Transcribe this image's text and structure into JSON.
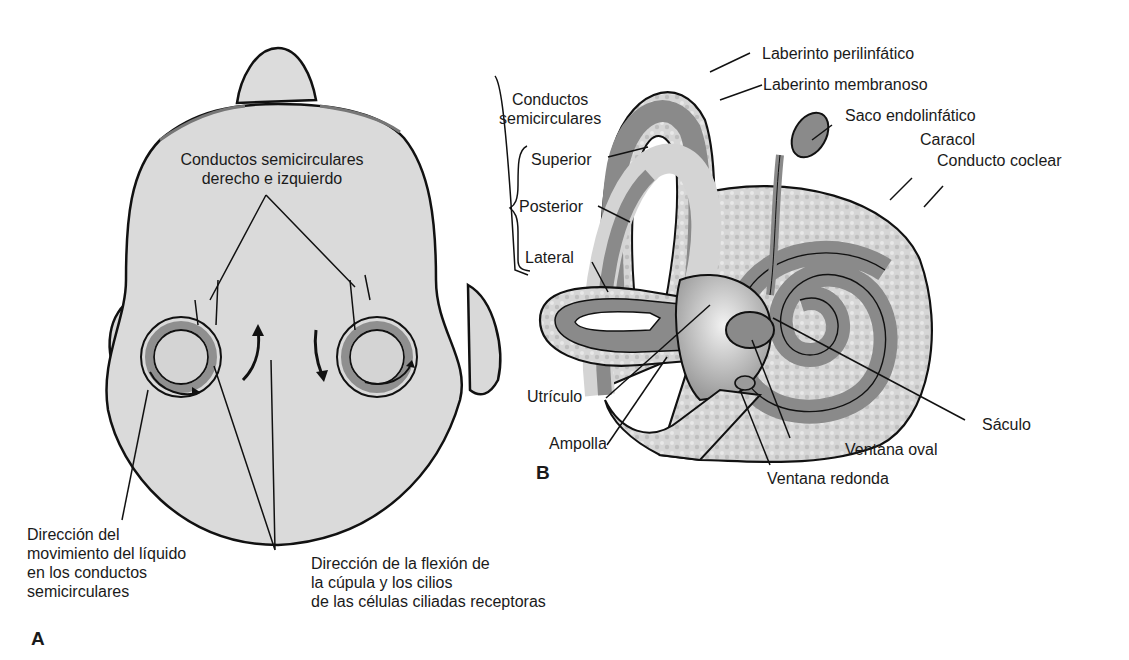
{
  "panel_a": {
    "letter": "A",
    "labels": {
      "canals_line1": "Conductos semicirculares",
      "canals_line2": "derecho e izquierdo",
      "fluid_line1": "Dirección del",
      "fluid_line2": "movimiento del líquido",
      "fluid_line3": "en los conductos",
      "fluid_line4": "semicirculares",
      "cupula_line1": "Dirección de la flexión de",
      "cupula_line2": "la cúpula y los cilios",
      "cupula_line3": "de las células ciliadas receptoras"
    }
  },
  "panel_b": {
    "letter": "B",
    "labels": {
      "perilymph": "Laberinto perilinfático",
      "membranous": "Laberinto membranoso",
      "canals_line1": "Conductos",
      "canals_line2": "semicirculares",
      "superior": "Superior",
      "posterior": "Posterior",
      "lateral": "Lateral",
      "endolymph_sac": "Saco endolinfático",
      "cochlea": "Caracol",
      "cochlear_duct": "Conducto coclear",
      "utricle": "Utrículo",
      "ampulla": "Ampolla",
      "saccule": "Sáculo",
      "oval_window": "Ventana oval",
      "round_window": "Ventana redonda"
    }
  },
  "colors": {
    "skin": "#d9d9d9",
    "duct_dark": "#8a8a8a",
    "perilymph_speckle": "#cfcfcf",
    "outline": "#111111"
  }
}
